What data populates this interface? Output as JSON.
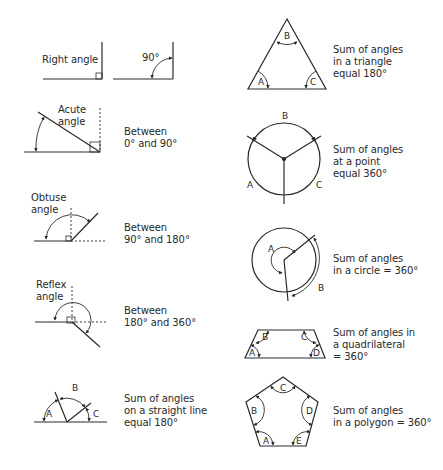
{
  "figures": {
    "right_angle": {
      "label": "Right angle"
    },
    "ninety": {
      "label": "90°"
    },
    "acute": {
      "label_line1": "Acute",
      "label_line2": "angle",
      "desc_line1": "Between",
      "desc_line2": "0° and 90°"
    },
    "obtuse": {
      "label_line1": "Obtuse",
      "label_line2": "angle",
      "desc_line1": "Between",
      "desc_line2": "90° and 180°"
    },
    "reflex": {
      "label_line1": "Reflex",
      "label_line2": "angle",
      "desc_line1": "Between",
      "desc_line2": "180° and 360°"
    },
    "straight_line": {
      "angles": [
        "A",
        "B",
        "C"
      ],
      "desc_line1": "Sum of angles",
      "desc_line2": "on a straight line",
      "desc_line3": "equal 180°"
    },
    "triangle": {
      "angles": [
        "A",
        "B",
        "C"
      ],
      "desc_line1": "Sum of angles",
      "desc_line2": "in a triangle",
      "desc_line3": "equal 180°"
    },
    "point": {
      "angles": [
        "A",
        "B",
        "C"
      ],
      "desc_line1": "Sum of angles",
      "desc_line2": "at a point",
      "desc_line3": "equal 360°"
    },
    "circle": {
      "angles": [
        "A",
        "B"
      ],
      "desc_line1": "Sum of angles",
      "desc_line2": "in a circle = 360°"
    },
    "quadrilateral": {
      "angles": [
        "A",
        "B",
        "C",
        "D"
      ],
      "desc_line1": "Sum of angles in",
      "desc_line2": "a quadrilateral",
      "desc_line3": "= 360°"
    },
    "polygon": {
      "angles": [
        "A",
        "B",
        "C",
        "D",
        "E"
      ],
      "desc_line1": "Sum of angles",
      "desc_line2": "in a polygon = 360°"
    }
  },
  "colors": {
    "stroke": "#2a2a2a",
    "background": "#ffffff"
  }
}
